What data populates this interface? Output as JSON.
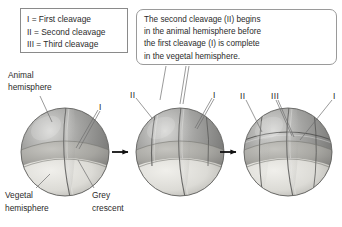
{
  "legend": {
    "name": "cleavage-legend",
    "rows": [
      "I = First cleavage",
      "II = Second cleavage",
      "III = Third cleavage"
    ]
  },
  "callout": {
    "name": "second-cleavage-callout",
    "lines": [
      "The second cleavage (II) begins",
      "in the animal hemisphere before",
      "the first cleavage (I) is complete",
      "in the vegetal hemisphere."
    ]
  },
  "labels": {
    "animal_hemisphere_line1": "Animal",
    "animal_hemisphere_line2": "hemisphere",
    "vegetal_hemisphere_line1": "Vegetal",
    "vegetal_hemisphere_line2": "hemisphere",
    "grey_crescent_line1": "Grey",
    "grey_crescent_line2": "crescent"
  },
  "embryos": [
    {
      "name": "embryo-stage-1",
      "stage": "two-cell",
      "furrow_labels": [
        {
          "text": "I",
          "name": "furrow-label-I"
        }
      ]
    },
    {
      "name": "embryo-stage-2",
      "stage": "four-cell",
      "furrow_labels": [
        {
          "text": "II",
          "name": "furrow-label-II"
        },
        {
          "text": "I",
          "name": "furrow-label-I"
        }
      ]
    },
    {
      "name": "embryo-stage-3",
      "stage": "eight-cell",
      "furrow_labels": [
        {
          "text": "II",
          "name": "furrow-label-II"
        },
        {
          "text": "III",
          "name": "furrow-label-III"
        },
        {
          "text": "I",
          "name": "furrow-label-I"
        }
      ]
    }
  ],
  "arrows": [
    {
      "name": "progression-arrow-1"
    },
    {
      "name": "progression-arrow-2"
    }
  ],
  "colors": {
    "background": "#ffffff",
    "text": "#2b2b2b",
    "box_border": "#8a8a8a",
    "callout_border": "#9a9a9a",
    "animal_hemisphere": "#8e8e8e",
    "vegetal_hemisphere": "#d6d6d2",
    "grey_crescent": "#a9a9a4",
    "leader_line": "#6e6e6e",
    "arrow": "#111111"
  }
}
